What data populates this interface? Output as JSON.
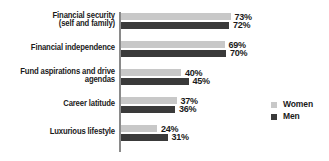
{
  "chart_data": {
    "type": "bar",
    "orientation": "horizontal",
    "title": "",
    "subtitle": "",
    "xlabel": "",
    "ylabel": "",
    "grid": false,
    "xlim": [
      0,
      80
    ],
    "legend_position": "right",
    "categories": [
      "Financial security\n(self and family)",
      "Financial independence",
      "Fund aspirations and drive\nagendas",
      "Career latitude",
      "Luxurious lifestyle"
    ],
    "series": [
      {
        "name": "Women",
        "color": "#c8c8c8",
        "values": [
          73,
          69,
          40,
          37,
          24
        ],
        "labels": [
          "73%",
          "69%",
          "40%",
          "37%",
          "24%"
        ]
      },
      {
        "name": "Men",
        "color": "#3a3a3a",
        "values": [
          72,
          70,
          45,
          36,
          31
        ],
        "labels": [
          "72%",
          "70%",
          "45%",
          "36%",
          "31%"
        ]
      }
    ]
  },
  "legend": {
    "items": [
      {
        "label": "Women",
        "color": "#c8c8c8"
      },
      {
        "label": "Men",
        "color": "#3a3a3a"
      }
    ]
  },
  "colors": {
    "women": "#c8c8c8",
    "men": "#3a3a3a",
    "axis": "#8a8a8a",
    "text": "#1a1a1a",
    "background": "#ffffff"
  }
}
